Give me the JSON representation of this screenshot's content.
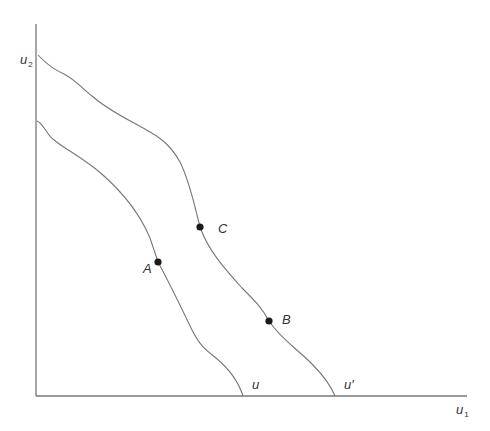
{
  "diagram": {
    "type": "utility-possibility-frontiers",
    "axes": {
      "y_label": {
        "base": "u",
        "sub": "2"
      },
      "x_label": {
        "base": "u",
        "sub": "1"
      }
    },
    "curves": [
      {
        "id": "inner",
        "label": "u"
      },
      {
        "id": "outer",
        "label": "u′"
      }
    ],
    "points": [
      {
        "id": "A",
        "label": "A",
        "curve": "inner"
      },
      {
        "id": "C",
        "label": "C",
        "curve": "outer"
      },
      {
        "id": "B",
        "label": "B",
        "curve": "outer"
      }
    ],
    "colors": {
      "line": "#777777",
      "point": "#1a1a1a",
      "text": "#333333"
    }
  }
}
